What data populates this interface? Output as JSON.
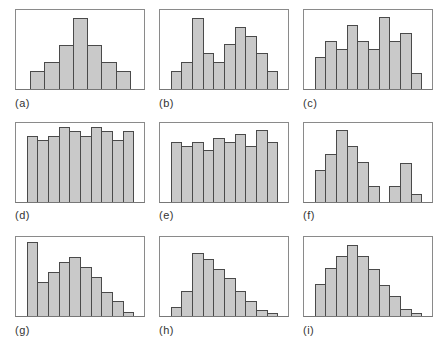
{
  "chart_data": [
    {
      "type": "bar",
      "id": "a",
      "label": "(a)",
      "slots": 9,
      "start_slot": 1,
      "values": [
        18,
        27,
        44,
        71,
        44,
        27,
        18
      ]
    },
    {
      "type": "bar",
      "id": "b",
      "label": "(b)",
      "slots": 12,
      "start_slot": 1,
      "values": [
        18,
        27,
        71,
        36,
        27,
        45,
        62,
        53,
        36,
        18
      ]
    },
    {
      "type": "bar",
      "id": "c",
      "label": "(c)",
      "slots": 12,
      "start_slot": 1,
      "values": [
        32,
        48,
        40,
        64,
        48,
        40,
        72,
        48,
        56,
        16
      ]
    },
    {
      "type": "bar",
      "id": "d",
      "label": "(d)",
      "slots": 12,
      "start_slot": 1,
      "values": [
        66,
        62,
        66,
        75,
        71,
        66,
        75,
        71,
        62,
        71
      ]
    },
    {
      "type": "bar",
      "id": "e",
      "label": "(e)",
      "slots": 12,
      "start_slot": 1,
      "values": [
        60,
        56,
        60,
        52,
        64,
        60,
        68,
        56,
        72,
        60
      ]
    },
    {
      "type": "bar",
      "id": "f",
      "label": "(f)",
      "slots": 12,
      "start_slot": 1,
      "values": [
        32,
        48,
        72,
        56,
        40,
        16,
        0,
        16,
        39,
        8
      ]
    },
    {
      "type": "bar",
      "id": "g",
      "label": "(g)",
      "slots": 12,
      "start_slot": 1,
      "values": [
        74,
        34,
        44,
        54,
        59,
        49,
        39,
        24,
        15,
        4
      ]
    },
    {
      "type": "bar",
      "id": "h",
      "label": "(h)",
      "slots": 12,
      "start_slot": 1,
      "values": [
        9,
        25,
        63,
        57,
        47,
        38,
        25,
        15,
        6,
        3
      ]
    },
    {
      "type": "bar",
      "id": "i",
      "label": "(i)",
      "slots": 12,
      "start_slot": 1,
      "values": [
        32,
        48,
        60,
        71,
        60,
        47,
        31,
        20,
        7,
        3
      ]
    }
  ],
  "style": {
    "bar_fill": "#c9c9c9",
    "bar_outline": "#4a4a4a",
    "frame_border": "#8a8a8a"
  }
}
